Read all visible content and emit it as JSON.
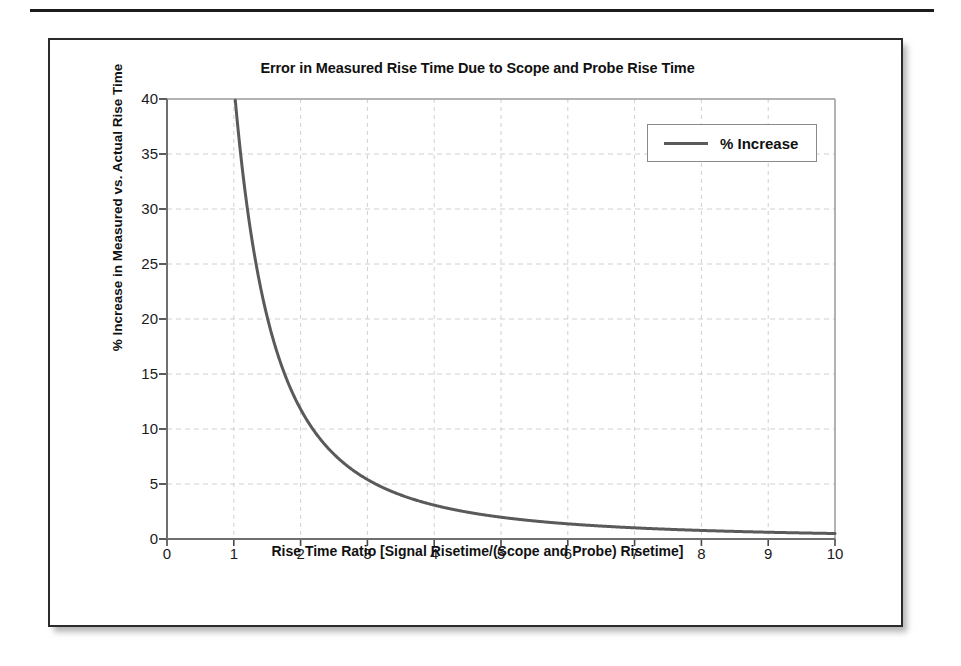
{
  "page": {
    "top_rule": "horizontal-rule"
  },
  "chart_data": {
    "type": "line",
    "title": "Error in Measured Rise Time Due to Scope and Probe Rise Time",
    "xlabel": "Rise Time Ratio [Signal Risetime/(Scope and Probe) Risetime]",
    "ylabel": "% Increase in Measured vs. Actual Rise Time",
    "xlim": [
      0,
      10
    ],
    "ylim": [
      0,
      40
    ],
    "xticks": [
      0,
      1,
      2,
      3,
      4,
      5,
      6,
      7,
      8,
      9,
      10
    ],
    "yticks": [
      0,
      5,
      10,
      15,
      20,
      25,
      30,
      35,
      40
    ],
    "grid": true,
    "grid_style": "dashed",
    "grid_color": "#d0d0d0",
    "legend_position": "upper-right",
    "series": [
      {
        "name": "% Increase",
        "color": "#5a5a5a",
        "line_width": 3,
        "formula": "100 * (sqrt(1 + 1/x^2) - 1)",
        "x": [
          1.0,
          1.05,
          1.1,
          1.2,
          1.3,
          1.4,
          1.5,
          1.6,
          1.7,
          1.8,
          1.9,
          2.0,
          2.2,
          2.4,
          2.6,
          2.8,
          3.0,
          3.2,
          3.4,
          3.6,
          3.8,
          4.0,
          4.5,
          5.0,
          5.5,
          6.0,
          6.5,
          7.0,
          7.5,
          8.0,
          8.5,
          9.0,
          9.5,
          10.0
        ],
        "y": [
          41.42,
          38.1,
          35.1,
          30.2,
          26.2,
          23.0,
          20.2,
          18.0,
          16.1,
          14.5,
          13.1,
          11.8,
          9.9,
          8.4,
          7.2,
          6.3,
          5.4,
          4.8,
          4.3,
          3.8,
          3.4,
          3.1,
          2.5,
          2.0,
          1.6,
          1.4,
          1.2,
          1.0,
          0.9,
          0.8,
          0.7,
          0.6,
          0.55,
          0.5
        ],
        "values_at_integer_x": {
          "1": 41.42,
          "2": 11.8,
          "3": 5.41,
          "4": 3.08,
          "5": 1.98,
          "6": 1.38,
          "7": 1.02,
          "8": 0.78,
          "9": 0.62,
          "10": 0.5
        },
        "clipped_above": 40
      }
    ]
  },
  "legend": {
    "entries": [
      {
        "label": "% Increase"
      }
    ]
  }
}
